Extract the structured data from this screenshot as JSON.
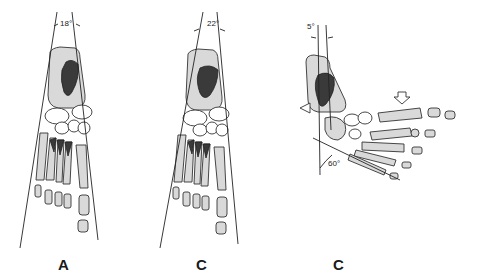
{
  "figure": {
    "panels": [
      {
        "label": "A",
        "angle_label": "18°",
        "view": "dorsoplantar"
      },
      {
        "label": "B",
        "angle_label": "22°",
        "view": "dorsoplantar"
      },
      {
        "label": "C",
        "angle_label_top": "5°",
        "angle_label_bottom": "60°",
        "view": "lateral"
      }
    ]
  },
  "colors": {
    "bone_fill": "#d9d9d9",
    "talus_fill": "#3a3a3a",
    "line": "#222222"
  }
}
